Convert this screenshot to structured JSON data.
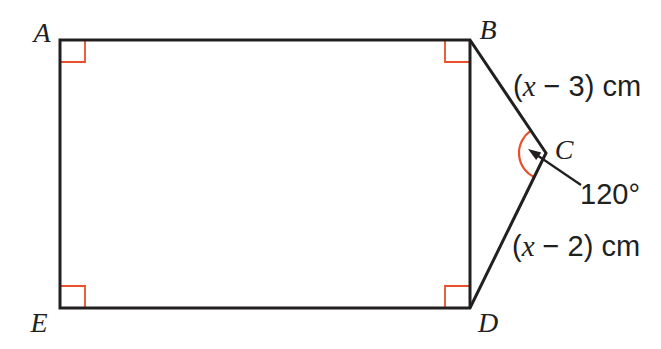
{
  "figure": {
    "type": "geometry-diagram",
    "colors": {
      "line": "#221f1f",
      "accent": "#e8502c",
      "text": "#221f1f",
      "background": "#ffffff"
    },
    "vertices": [
      {
        "name": "A",
        "label": "A",
        "x": 60,
        "y": 40,
        "lx": 42,
        "ly": 42
      },
      {
        "name": "B",
        "label": "B",
        "x": 470,
        "y": 40,
        "lx": 488,
        "ly": 39
      },
      {
        "name": "C",
        "label": "C",
        "x": 546,
        "y": 153,
        "lx": 564,
        "ly": 159
      },
      {
        "name": "D",
        "label": "D",
        "x": 470,
        "y": 308,
        "lx": 488,
        "ly": 332
      },
      {
        "name": "E",
        "label": "E",
        "x": 60,
        "y": 308,
        "lx": 39,
        "ly": 332
      }
    ],
    "outline": [
      "A",
      "B",
      "C",
      "D",
      "E"
    ],
    "inner_edges": [
      [
        "B",
        "D"
      ]
    ],
    "mark_size": {
      "w": 25,
      "h": 22
    },
    "right_angle_marks": [
      {
        "at": "A",
        "dx": 1,
        "dy": 1
      },
      {
        "at": "B",
        "dx": -1,
        "dy": 1
      },
      {
        "at": "D",
        "dx": -1,
        "dy": -1
      },
      {
        "at": "E",
        "dx": 1,
        "dy": -1
      }
    ],
    "angle_c": {
      "label": "120°",
      "value": 120,
      "radius": 27,
      "label_x": 580,
      "label_y": 204,
      "leader_from": [
        581,
        185
      ],
      "leader_tip": [
        528,
        149
      ]
    },
    "side_labels": [
      {
        "side": "BC",
        "x": 513,
        "y": 96,
        "text": "(x − 3) cm",
        "runs": [
          {
            "t": "(",
            "it": false
          },
          {
            "t": "x",
            "it": true
          },
          {
            "t": " − 3) cm",
            "it": false
          }
        ]
      },
      {
        "side": "CD",
        "x": 512,
        "y": 256,
        "text": "(x − 2) cm",
        "runs": [
          {
            "t": "(",
            "it": false
          },
          {
            "t": "x",
            "it": true
          },
          {
            "t": " − 2) cm",
            "it": false
          }
        ]
      }
    ]
  }
}
